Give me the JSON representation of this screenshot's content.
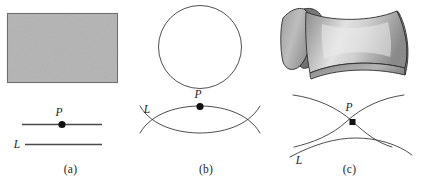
{
  "figure": {
    "background_color": "#ffffff",
    "ink_color": "#1d1d1d",
    "surface_fill_color": "#b7b7b7",
    "surface_edge_color": "#6e6e6e"
  },
  "panels": [
    {
      "id": "a",
      "caption": "(a)",
      "surface_kind": "flat-plane",
      "surface_shape": "rectangle",
      "point_label": "P",
      "line_label": "L",
      "geodesic_description": "straight line through P with a second straight line L below",
      "curves": [
        {
          "name": "line-through-P",
          "type": "straight"
        },
        {
          "name": "line-L",
          "type": "straight"
        }
      ]
    },
    {
      "id": "b",
      "caption": "(b)",
      "surface_kind": "sphere",
      "surface_shape": "circle",
      "point_label": "P",
      "line_label": "L",
      "geodesic_description": "two great-circle arcs forming a lens, crossing on both sides of P",
      "curves": [
        {
          "name": "upper-arc",
          "type": "arc"
        },
        {
          "name": "lower-arc",
          "type": "arc"
        }
      ]
    },
    {
      "id": "c",
      "caption": "(c)",
      "surface_kind": "saddle",
      "surface_shape": "hyperbolic-paraboloid",
      "point_label": "P",
      "line_label": "L",
      "geodesic_description": "two diverging curves crossing at P with a separate arc L below",
      "curves": [
        {
          "name": "rising-curve",
          "type": "hyperbolic"
        },
        {
          "name": "falling-curve",
          "type": "hyperbolic"
        },
        {
          "name": "curve-L",
          "type": "hyperbolic"
        }
      ]
    }
  ],
  "labels": {
    "point": "P",
    "line": "L",
    "caption_a": "(a)",
    "caption_b": "(b)",
    "caption_c": "(c)"
  }
}
